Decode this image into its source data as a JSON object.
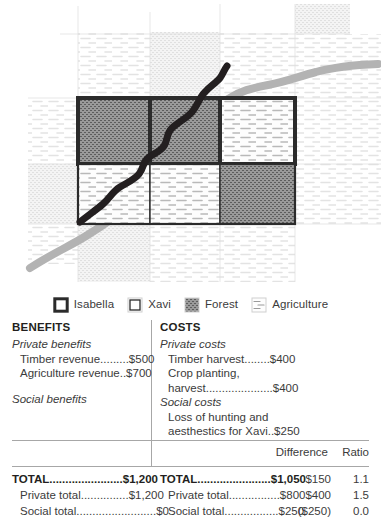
{
  "map": {
    "alt": "Land parcel map showing Isabella's and Xavi's holdings over forest and agriculture land, crossed by a river and a property boundary line",
    "parcels": [
      {
        "owner": "Isabella",
        "cover": "Forest",
        "row": 0,
        "col": 0
      },
      {
        "owner": "Isabella",
        "cover": "Forest",
        "row": 0,
        "col": 1
      },
      {
        "owner": "Isabella",
        "cover": "Agriculture",
        "row": 0,
        "col": 2
      },
      {
        "owner": "Xavi",
        "cover": "Agriculture",
        "row": 1,
        "col": 0
      },
      {
        "owner": "Xavi",
        "cover": "Agriculture",
        "row": 1,
        "col": 1
      },
      {
        "owner": "Xavi",
        "cover": "Forest",
        "row": 1,
        "col": 2
      }
    ],
    "features": [
      {
        "name": "river",
        "color": "#b3b3b3"
      },
      {
        "name": "boundary-line",
        "color": "#231f20"
      }
    ]
  },
  "legend": {
    "items": [
      {
        "label": "Isabella",
        "icon": "isabella-swatch"
      },
      {
        "label": "Xavi",
        "icon": "xavi-swatch"
      },
      {
        "label": "Forest",
        "icon": "forest-swatch"
      },
      {
        "label": "Agriculture",
        "icon": "agriculture-swatch"
      }
    ]
  },
  "ledger": {
    "benefits": {
      "heading": "BENEFITS",
      "private_label": "Private benefits",
      "private_entries": [
        "Timber revenue.........$500",
        "Agriculture revenue..$700"
      ],
      "social_label": "Social benefits",
      "social_entries": []
    },
    "costs": {
      "heading": "COSTS",
      "private_label": "Private costs",
      "private_entries": [
        "Timber harvest........$400",
        "Crop planting,",
        "harvest.....................$400"
      ],
      "social_label": "Social costs",
      "social_entries": [
        "Loss of hunting and",
        "aesthestics for Xavi..$250"
      ]
    },
    "columns": {
      "difference": "Difference",
      "ratio": "Ratio"
    },
    "totals": [
      {
        "benefits": "TOTAL.......................$1,200",
        "costs": "TOTAL.......................$1,050",
        "difference": "$150",
        "ratio": "1.1",
        "bold": true
      },
      {
        "benefits": "Private total...............$1,200",
        "costs": "Private total................$800",
        "difference": "$400",
        "ratio": "1.5",
        "bold": false
      },
      {
        "benefits": "Social total.........................$0",
        "costs": "Social total.................$250",
        "difference": "($250)",
        "ratio": "0.0",
        "bold": false
      }
    ]
  }
}
